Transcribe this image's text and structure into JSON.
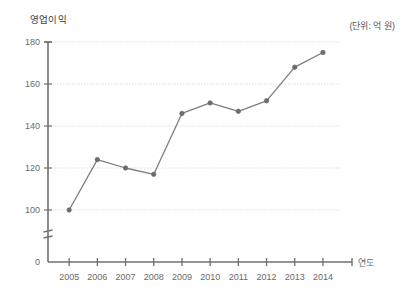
{
  "chart_data": {
    "type": "line",
    "title": "",
    "ylabel": "영업이익",
    "xlabel": "연도",
    "unit_note": "(단위: 억 원)",
    "categories": [
      "2005",
      "2006",
      "2007",
      "2008",
      "2009",
      "2010",
      "2011",
      "2012",
      "2013",
      "2014"
    ],
    "values": [
      100,
      124,
      120,
      117,
      146,
      151,
      147,
      152,
      168,
      175
    ],
    "series": [
      {
        "name": "영업이익",
        "values": [
          100,
          124,
          120,
          117,
          146,
          151,
          147,
          152,
          168,
          175
        ]
      }
    ],
    "y_ticks": [
      "0",
      "100",
      "120",
      "140",
      "160",
      "180"
    ],
    "y_tick_values": [
      0,
      100,
      120,
      140,
      160,
      180
    ],
    "ylim": [
      0,
      180
    ],
    "axis_break": true,
    "axis_break_between": [
      0,
      100
    ],
    "grid": true,
    "grid_style": "dotted",
    "legend": "none",
    "marker": "circle",
    "colors": {
      "line": "#7d7d7d",
      "marker": "#6d6d6d",
      "axis": "#707070",
      "grid": "#dddddd",
      "text": "#6a6a6a",
      "background": "#ffffff"
    }
  },
  "labels": {
    "y_axis_title": "영업이익",
    "x_axis_title": "연도",
    "unit": "(단위: 억 원)"
  }
}
